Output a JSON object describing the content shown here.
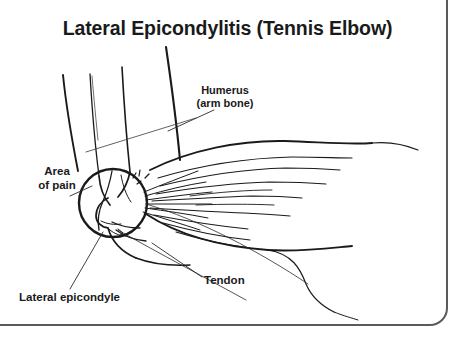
{
  "page": {
    "title": "Lateral Epicondylitis (Tennis Elbow)",
    "background_color": "#ffffff",
    "ink_color": "#1a1a1a",
    "frame_color": "#5a5a5a"
  },
  "labels": {
    "area_of_pain_line1": "Area",
    "area_of_pain_line2": "of pain",
    "humerus_line1": "Humerus",
    "humerus_line2": "(arm bone)",
    "tendon": "Tendon",
    "lateral_epicondyle": "Lateral epicondyle"
  },
  "illustration": {
    "subject": "right elbow, lateral view line drawing",
    "parts": [
      "upper arm (humerus) shaft",
      "elbow joint with lateral epicondyle",
      "common extensor tendon origin",
      "forearm extensor muscle belly with fiber striations",
      "distal forearm toward wrist"
    ],
    "magnifier": {
      "shape": "circle",
      "center_x": 113,
      "center_y": 203,
      "radius": 34,
      "depicts": "lateral epicondyle and inflamed tendon attachment"
    }
  }
}
